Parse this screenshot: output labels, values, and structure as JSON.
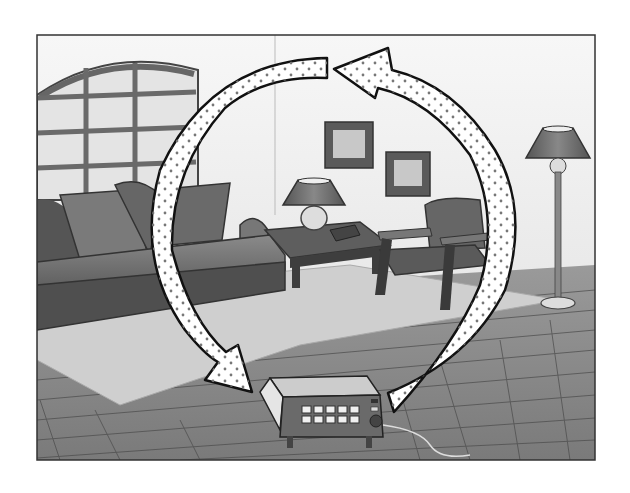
{
  "diagram": {
    "colors": {
      "background": "#ffffff",
      "wall": "#f2f2f2",
      "frame": "#333333",
      "floor": "#8a8a8a",
      "floor_lines": "#4a4a4a",
      "rug": "#cfcfcf",
      "sofa": "#6e6e6e",
      "furniture_dark": "#4d4d4d",
      "arrow_fill": "#ffffff",
      "arrow_outline": "#111111",
      "arrow_dots": "#777777"
    },
    "objects": [
      {
        "name": "arched-window",
        "label": "Arched window"
      },
      {
        "name": "sofa",
        "label": "Sofa with cushions"
      },
      {
        "name": "coffee-table",
        "label": "Side table with lamp and book"
      },
      {
        "name": "table-lamp",
        "label": "Table lamp"
      },
      {
        "name": "picture-frame-1",
        "label": "Framed picture"
      },
      {
        "name": "picture-frame-2",
        "label": "Framed picture"
      },
      {
        "name": "armchair",
        "label": "Armchair"
      },
      {
        "name": "floor-lamp",
        "label": "Floor lamp"
      },
      {
        "name": "rug",
        "label": "Rug"
      },
      {
        "name": "tiled-floor",
        "label": "Tiled floor"
      },
      {
        "name": "heater",
        "label": "Portable electric heater"
      }
    ],
    "arrows": [
      {
        "name": "warm-air-arrow",
        "direction": "up from heater on right, curving over the top toward the left"
      },
      {
        "name": "cool-air-arrow",
        "direction": "down on the left, curving toward the heater"
      }
    ]
  }
}
